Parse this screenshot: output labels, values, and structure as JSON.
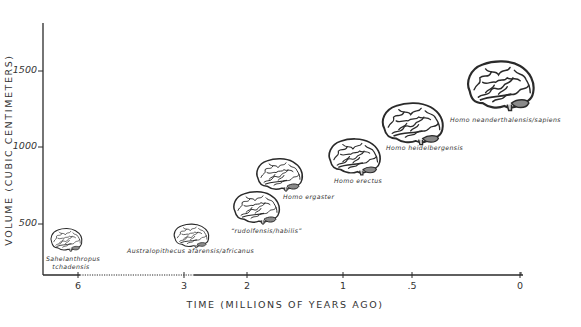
{
  "chart_data": {
    "type": "scatter",
    "title": "",
    "xlabel": "TIME  (MILLIONS OF YEARS AGO)",
    "ylabel": "VOLUME (CUBIC CENTIMETERS)",
    "x_ticks": [
      "6",
      "3",
      "2",
      "1",
      ".5",
      "0"
    ],
    "y_ticks": [
      "500",
      "1000",
      "1500"
    ],
    "x_axis": "non-linear time scale, decreasing to the right",
    "ylim": [
      300,
      1750
    ],
    "grid": false,
    "legend": "none",
    "marker": "brain illustration (size increases with volume)",
    "points": [
      {
        "name": "Sahelanthropus tchadensis",
        "label_lines": [
          "Sahelanthropus",
          "tchadensis"
        ],
        "time_mya": 6.0,
        "volume_cc": 390
      },
      {
        "name": "Australopithecus afarensis/africanus",
        "label_lines": [
          "Australopithecus afarensis/africanus"
        ],
        "time_mya": 3.0,
        "volume_cc": 420
      },
      {
        "name": "“rudolfensis/habilis”",
        "label_lines": [
          "“rudolfensis/habilis”"
        ],
        "time_mya": 2.0,
        "volume_cc": 600
      },
      {
        "name": "Homo ergaster",
        "label_lines": [
          "Homo ergaster"
        ],
        "time_mya": 1.7,
        "volume_cc": 820
      },
      {
        "name": "Homo erectus",
        "label_lines": [
          "Homo erectus"
        ],
        "time_mya": 1.0,
        "volume_cc": 930
      },
      {
        "name": "Homo heidelbergensis",
        "label_lines": [
          "Homo heidelbergensis"
        ],
        "time_mya": 0.5,
        "volume_cc": 1150
      },
      {
        "name": "Homo neanderthalensis/sapiens",
        "label_lines": [
          "Homo neanderthalensis/sapiens"
        ],
        "time_mya": 0.1,
        "volume_cc": 1400
      }
    ]
  },
  "axes": {
    "ylabel": "VOLUME (CUBIC CENTIMETERS)",
    "xlabel": "TIME  (MILLIONS OF YEARS AGO)",
    "y_ticks": [
      {
        "label": "1500",
        "y": 71
      },
      {
        "label": "1000",
        "y": 147
      },
      {
        "label": "500",
        "y": 224
      }
    ],
    "x_ticks": [
      {
        "label": "6",
        "x": 78
      },
      {
        "label": "3",
        "x": 184
      },
      {
        "label": "2",
        "x": 247
      },
      {
        "label": "1",
        "x": 343
      },
      {
        "label": ".5",
        "x": 412
      },
      {
        "label": "0",
        "x": 520
      }
    ]
  },
  "specimens": [
    {
      "line1": "Sahelanthropus",
      "line2": "tchadensis",
      "cx": 66,
      "cy": 240,
      "w": 34,
      "h": 24,
      "lx": 46,
      "ly": 254
    },
    {
      "line1": "Australopithecus afarensis/africanus",
      "line2": "",
      "cx": 191,
      "cy": 236,
      "w": 38,
      "h": 25,
      "lx": 127,
      "ly": 248
    },
    {
      "line1": "“rudolfensis/habilis”",
      "line2": "",
      "cx": 256,
      "cy": 208,
      "w": 50,
      "h": 34,
      "lx": 231,
      "ly": 227
    },
    {
      "line1": "Homo ergaster",
      "line2": "",
      "cx": 279,
      "cy": 175,
      "w": 50,
      "h": 34,
      "lx": 283,
      "ly": 194
    },
    {
      "line1": "Homo erectus",
      "line2": "",
      "cx": 354,
      "cy": 157,
      "w": 56,
      "h": 38,
      "lx": 334,
      "ly": 178
    },
    {
      "line1": "Homo heidelbergensis",
      "line2": "",
      "cx": 412,
      "cy": 124,
      "w": 66,
      "h": 44,
      "lx": 386,
      "ly": 145
    },
    {
      "line1": "Homo neanderthalensis/sapiens",
      "line2": "",
      "cx": 500,
      "cy": 86,
      "w": 72,
      "h": 52,
      "lx": 450,
      "ly": 117
    }
  ],
  "colors": {
    "ink": "#2a2a2a",
    "background": "#ffffff",
    "cerebellum": "#8a8a8a"
  }
}
